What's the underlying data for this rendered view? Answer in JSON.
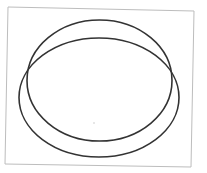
{
  "diagram": {
    "canvas": {
      "width": 207,
      "height": 173,
      "background": "#ffffff"
    },
    "frame": {
      "points": [
        [
          8,
          7
        ],
        [
          194,
          11
        ],
        [
          191,
          167
        ],
        [
          5,
          164
        ]
      ],
      "stroke": "#bdbdbd",
      "stroke_width": 1
    },
    "ellipses": [
      {
        "name": "upper-ellipse",
        "cx": 99.5,
        "cy": 80.5,
        "rx": 72.5,
        "ry": 60.5,
        "stroke": "#333333",
        "stroke_width": 1.6
      },
      {
        "name": "lower-ellipse",
        "cx": 99,
        "cy": 97.5,
        "rx": 80,
        "ry": 59.5,
        "stroke": "#333333",
        "stroke_width": 1.6
      }
    ],
    "dot": {
      "cx": 94,
      "cy": 123,
      "r": 0.8,
      "fill": "#c8c8c8"
    }
  }
}
